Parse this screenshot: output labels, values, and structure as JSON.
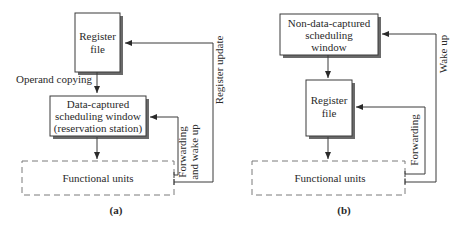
{
  "diagram_a": {
    "caption": "(a)",
    "register_file": {
      "line1": "Register",
      "line2": "file"
    },
    "operand_copying_label": "Operand copying",
    "scheduling_window": {
      "line1": "Data-captured",
      "line2": "scheduling window",
      "line3": "(reservation station)"
    },
    "functional_units": "Functional units",
    "forwarding_label": {
      "line1": "Forwarding",
      "line2": "and wake up"
    },
    "register_update_label": "Register update"
  },
  "diagram_b": {
    "caption": "(b)",
    "scheduling_window": {
      "line1": "Non-data-captured",
      "line2": "scheduling",
      "line3": "window"
    },
    "register_file": {
      "line1": "Register",
      "line2": "file"
    },
    "functional_units": "Functional units",
    "forwarding_label": "Forwarding",
    "wake_up_label": "Wake up"
  },
  "colors": {
    "stroke": "#3a3a3a",
    "shadow": "#6a6a6a",
    "dashed": "#7a7a7a",
    "text": "#2a2a2a"
  }
}
